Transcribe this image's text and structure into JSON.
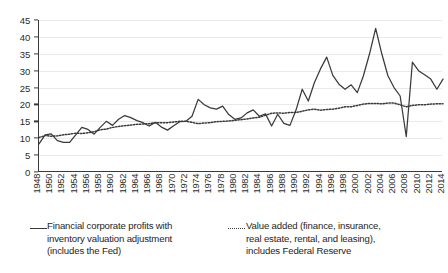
{
  "chart_data": {
    "type": "line",
    "title": "",
    "xlabel": "",
    "ylabel": "",
    "ylim": [
      0,
      45
    ],
    "ytick_step": 5,
    "grid": true,
    "legend_position": "bottom",
    "xtick_step": 2,
    "yticks": [
      0,
      5,
      10,
      15,
      20,
      25,
      30,
      35,
      40,
      45
    ],
    "xticks": [
      1948,
      1950,
      1952,
      1954,
      1956,
      1958,
      1960,
      1962,
      1964,
      1966,
      1968,
      1970,
      1972,
      1974,
      1976,
      1978,
      1980,
      1982,
      1984,
      1986,
      1988,
      1990,
      1992,
      1994,
      1996,
      1998,
      2000,
      2002,
      2004,
      2006,
      2008,
      2010,
      2012,
      2014
    ],
    "x": [
      1948,
      1949,
      1950,
      1951,
      1952,
      1953,
      1954,
      1955,
      1956,
      1957,
      1958,
      1959,
      1960,
      1961,
      1962,
      1963,
      1964,
      1965,
      1966,
      1967,
      1968,
      1969,
      1970,
      1971,
      1972,
      1973,
      1974,
      1975,
      1976,
      1977,
      1978,
      1979,
      1980,
      1981,
      1982,
      1983,
      1984,
      1985,
      1986,
      1987,
      1988,
      1989,
      1990,
      1991,
      1992,
      1993,
      1994,
      1995,
      1996,
      1997,
      1998,
      1999,
      2000,
      2001,
      2002,
      2003,
      2004,
      2005,
      2006,
      2007,
      2008,
      2009,
      2010,
      2011,
      2012,
      2013,
      2014
    ],
    "series": [
      {
        "name": "Financial corporate profits with inventory valuation adjustment (includes the Fed)",
        "style": "solid",
        "color": "#3a3a3a",
        "values": [
          8.3,
          11.0,
          11.3,
          9.3,
          8.8,
          8.8,
          11.0,
          13.2,
          12.6,
          11.2,
          13.2,
          15.0,
          13.8,
          15.6,
          16.7,
          16.1,
          15.2,
          14.6,
          13.6,
          14.7,
          13.3,
          12.4,
          13.7,
          14.9,
          15.0,
          16.5,
          21.5,
          19.9,
          19.0,
          18.6,
          19.5,
          17.0,
          15.6,
          16.0,
          17.5,
          18.4,
          16.5,
          17.2,
          13.6,
          17.1,
          14.4,
          13.8,
          18.4,
          24.5,
          21.0,
          26.5,
          30.6,
          34.0,
          28.6,
          26.0,
          24.5,
          25.8,
          23.5,
          28.5,
          35.0,
          42.5,
          35.0,
          28.5,
          25.0,
          22.5,
          10.5,
          32.5,
          30.0,
          28.8,
          27.5,
          24.5,
          27.5
        ]
      },
      {
        "name": "Value added (finance, insurance, real estate, rental, and leasing), includes Federal Reserve",
        "style": "dotted",
        "color": "#3a3a3a",
        "values": [
          10.2,
          10.8,
          10.6,
          10.7,
          11.0,
          11.2,
          11.5,
          11.4,
          11.6,
          11.9,
          12.5,
          12.7,
          13.2,
          13.5,
          13.7,
          13.9,
          14.1,
          14.2,
          14.3,
          14.6,
          14.6,
          14.6,
          14.8,
          15.0,
          15.0,
          14.7,
          14.3,
          14.5,
          14.6,
          14.9,
          15.0,
          15.1,
          15.3,
          15.5,
          15.7,
          16.0,
          16.2,
          16.8,
          17.4,
          17.5,
          17.4,
          17.6,
          17.6,
          18.0,
          18.4,
          18.6,
          18.3,
          18.5,
          18.6,
          18.9,
          19.3,
          19.3,
          19.7,
          20.1,
          20.3,
          20.3,
          20.2,
          20.4,
          20.4,
          19.9,
          19.3,
          19.7,
          19.9,
          19.9,
          20.1,
          20.2,
          20.2
        ]
      }
    ]
  },
  "legend": {
    "entries": [
      {
        "line1": "Financial corporate profits with",
        "line2": "inventory valuation adjustment",
        "line3": "(includes the Fed)",
        "marker": "solid-line-marker"
      },
      {
        "line1": "Value added (finance, insurance,",
        "line2": "real estate, rental, and leasing),",
        "line3": "includes Federal Reserve",
        "marker": "dotted-line-marker"
      }
    ]
  },
  "colors": {
    "line": "#3a3a3a",
    "axis": "#3a3a3a",
    "grid": "#e9e9ed",
    "text": "#2b2b2b",
    "background": "#ffffff"
  }
}
